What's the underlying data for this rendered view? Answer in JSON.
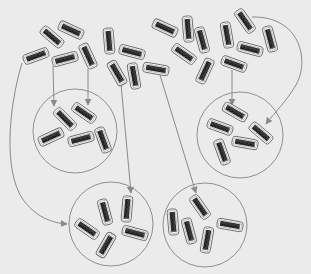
{
  "colors": {
    "background": "#ebebeb",
    "arrow": "#8a8a8a",
    "circle": "#8f8f8f",
    "capsule_fill": "#ffffff",
    "capsule_stroke": "#6a6a6a",
    "capsule_core": "#2a2a2a"
  },
  "capsule_size": {
    "w": 26,
    "h": 10
  },
  "free_capsules": [
    {
      "cx": 52,
      "cy": 37,
      "angle": 40
    },
    {
      "cx": 71,
      "cy": 30,
      "angle": 25
    },
    {
      "cx": 36,
      "cy": 56,
      "angle": -20
    },
    {
      "cx": 65,
      "cy": 59,
      "angle": -15
    },
    {
      "cx": 88,
      "cy": 56,
      "angle": 65
    },
    {
      "cx": 109,
      "cy": 41,
      "angle": 85
    },
    {
      "cx": 132,
      "cy": 52,
      "angle": 15
    },
    {
      "cx": 117,
      "cy": 73,
      "angle": 60
    },
    {
      "cx": 134,
      "cy": 76,
      "angle": 80
    },
    {
      "cx": 156,
      "cy": 69,
      "angle": 10
    },
    {
      "cx": 165,
      "cy": 28,
      "angle": 25
    },
    {
      "cx": 188,
      "cy": 29,
      "angle": 85
    },
    {
      "cx": 202,
      "cy": 40,
      "angle": 75
    },
    {
      "cx": 184,
      "cy": 54,
      "angle": 35
    },
    {
      "cx": 205,
      "cy": 71,
      "angle": 115
    },
    {
      "cx": 227,
      "cy": 35,
      "angle": 80
    },
    {
      "cx": 245,
      "cy": 21,
      "angle": 55
    },
    {
      "cx": 270,
      "cy": 39,
      "angle": 75
    },
    {
      "cx": 250,
      "cy": 49,
      "angle": 15
    },
    {
      "cx": 234,
      "cy": 64,
      "angle": 20
    }
  ],
  "groups": [
    {
      "name": "group-top-left",
      "circle": {
        "cx": 75,
        "cy": 131,
        "r": 42
      },
      "capsules": [
        {
          "cx": 65,
          "cy": 119,
          "angle": 45
        },
        {
          "cx": 84,
          "cy": 113,
          "angle": 35
        },
        {
          "cx": 51,
          "cy": 137,
          "angle": -25
        },
        {
          "cx": 81,
          "cy": 139,
          "angle": -15
        },
        {
          "cx": 103,
          "cy": 140,
          "angle": 70
        }
      ]
    },
    {
      "name": "group-top-right",
      "circle": {
        "cx": 240,
        "cy": 135,
        "r": 43
      },
      "capsules": [
        {
          "cx": 235,
          "cy": 112,
          "angle": 30
        },
        {
          "cx": 220,
          "cy": 127,
          "angle": 20
        },
        {
          "cx": 261,
          "cy": 133,
          "angle": 40
        },
        {
          "cx": 245,
          "cy": 143,
          "angle": 10
        },
        {
          "cx": 222,
          "cy": 152,
          "angle": 70
        }
      ]
    },
    {
      "name": "group-bottom-left",
      "circle": {
        "cx": 111,
        "cy": 224,
        "r": 42
      },
      "capsules": [
        {
          "cx": 105,
          "cy": 212,
          "angle": 75
        },
        {
          "cx": 127,
          "cy": 209,
          "angle": 95
        },
        {
          "cx": 87,
          "cy": 229,
          "angle": 35
        },
        {
          "cx": 135,
          "cy": 233,
          "angle": 15
        },
        {
          "cx": 106,
          "cy": 245,
          "angle": -60
        }
      ]
    },
    {
      "name": "group-bottom-right",
      "circle": {
        "cx": 205,
        "cy": 225,
        "r": 42
      },
      "capsules": [
        {
          "cx": 200,
          "cy": 207,
          "angle": 55
        },
        {
          "cx": 173,
          "cy": 222,
          "angle": 85
        },
        {
          "cx": 189,
          "cy": 231,
          "angle": 75
        },
        {
          "cx": 207,
          "cy": 240,
          "angle": 100
        },
        {
          "cx": 230,
          "cy": 225,
          "angle": 10
        }
      ]
    }
  ],
  "arrows": [
    {
      "name": "arrow-to-top-left-a",
      "d": "M53 66 L54 106"
    },
    {
      "name": "arrow-to-top-left-b",
      "d": "M88 69 L88 105"
    },
    {
      "name": "arrow-to-top-right-a",
      "d": "M232 70 L232 105"
    },
    {
      "name": "arrow-to-top-right-curve",
      "d": "M252 17 C300 16 310 60 296 85 C286 102 275 112 266 124"
    },
    {
      "name": "arrow-to-bottom-left-top",
      "d": "M121 84 L131 193"
    },
    {
      "name": "arrow-to-bottom-left-curve",
      "d": "M22 63 C8 110 4 170 22 198 C35 217 52 223 67 224"
    },
    {
      "name": "arrow-to-bottom-right-top",
      "d": "M160 75 L196 193"
    }
  ]
}
